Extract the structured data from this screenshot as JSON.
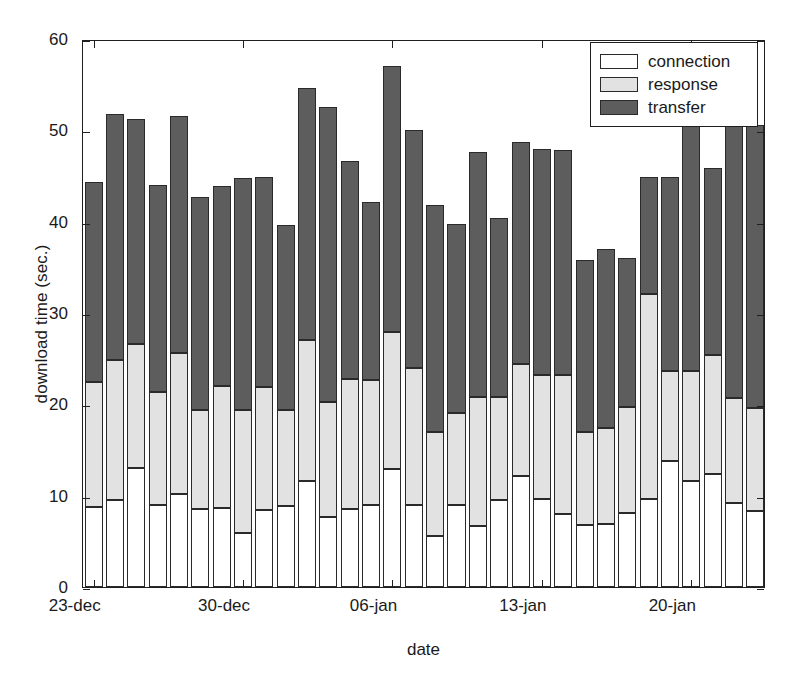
{
  "chart_data": {
    "type": "bar",
    "stacked": true,
    "title": "",
    "xlabel": "date",
    "ylabel": "download time (sec.)",
    "ylim": [
      0,
      60
    ],
    "ytick_labels": [
      "0",
      "10",
      "20",
      "30",
      "40",
      "50",
      "60"
    ],
    "yticks": [
      0,
      10,
      20,
      30,
      40,
      50,
      60
    ],
    "xtick_labels": [
      "23-dec",
      "30-dec",
      "06-jan",
      "13-jan",
      "20-jan"
    ],
    "xticks": [
      0,
      7,
      14,
      21,
      28
    ],
    "grid": false,
    "legend_position": "top-right",
    "colors": {
      "connection": "#ffffff",
      "response": "#e2e2e2",
      "transfer": "#5d5d5d",
      "axis": "#1f1f1f"
    },
    "categories": [
      "23-dec",
      "24-dec",
      "25-dec",
      "26-dec",
      "27-dec",
      "28-dec",
      "29-dec",
      "30-dec",
      "31-dec",
      "01-jan",
      "02-jan",
      "03-jan",
      "04-jan",
      "05-jan",
      "06-jan",
      "07-jan",
      "08-jan",
      "09-jan",
      "10-jan",
      "11-jan",
      "12-jan",
      "13-jan",
      "14-jan",
      "15-jan",
      "16-jan",
      "17-jan",
      "18-jan",
      "19-jan",
      "20-jan",
      "21-jan",
      "22-jan",
      "23-jan"
    ],
    "series": [
      {
        "name": "connection",
        "color": "#ffffff",
        "values": [
          8.8,
          9.5,
          13.0,
          9.0,
          10.2,
          8.5,
          8.7,
          5.9,
          8.4,
          8.9,
          11.6,
          7.7,
          8.5,
          9.0,
          12.9,
          9.0,
          5.6,
          9.0,
          6.7,
          9.5,
          12.2,
          9.6,
          8.0,
          6.8,
          6.9,
          8.1,
          9.6,
          13.8,
          11.6,
          12.4,
          9.2,
          8.3
        ]
      },
      {
        "name": "response",
        "color": "#e2e2e2",
        "values": [
          13.6,
          15.4,
          13.6,
          12.4,
          15.4,
          10.9,
          13.3,
          13.5,
          13.5,
          10.5,
          15.4,
          12.6,
          14.3,
          13.7,
          15.0,
          15.0,
          11.4,
          10.1,
          14.1,
          11.3,
          12.2,
          13.6,
          15.2,
          10.2,
          10.5,
          11.6,
          22.5,
          9.8,
          12.0,
          13.0,
          11.5,
          11.3
        ]
      },
      {
        "name": "transfer",
        "color": "#5d5d5d",
        "values": [
          21.9,
          26.9,
          24.6,
          22.6,
          26.0,
          23.3,
          21.9,
          25.4,
          23.0,
          20.2,
          27.6,
          32.3,
          23.8,
          19.5,
          29.2,
          26.0,
          24.8,
          20.7,
          26.8,
          19.6,
          24.3,
          24.8,
          24.6,
          18.8,
          19.6,
          16.3,
          12.8,
          21.3,
          32.4,
          20.5,
          29.9,
          31.0
        ]
      }
    ],
    "totals": [
      44.3,
      51.8,
      51.2,
      44.0,
      51.6,
      42.7,
      43.9,
      44.8,
      44.9,
      39.6,
      54.6,
      52.6,
      46.6,
      42.2,
      57.1,
      50.0,
      41.8,
      39.8,
      47.6,
      40.4,
      48.7,
      48.0,
      47.8,
      35.8,
      37.0,
      36.0,
      44.9,
      44.9,
      56.0,
      45.9,
      50.6,
      50.6
    ]
  },
  "legend": {
    "items": [
      {
        "label": "connection",
        "color": "#ffffff"
      },
      {
        "label": "response",
        "color": "#e2e2e2"
      },
      {
        "label": "transfer",
        "color": "#5d5d5d"
      }
    ]
  }
}
